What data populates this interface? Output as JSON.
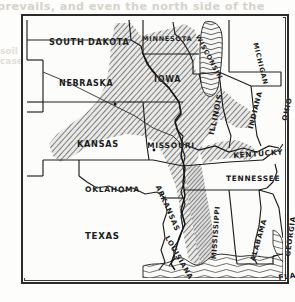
{
  "page": {
    "bleed_text_top": "prevails, and even the north side of the",
    "bleed_text_left": "soil in all cases",
    "background_color": "#fdfdfb",
    "ink_color": "#1b1b1b",
    "frame_color": "#2b2b2b",
    "shading_color": "#8a8a8a",
    "water_color": "#6f6f6f"
  },
  "map": {
    "title": "",
    "kind": "thematic-region-map",
    "legend_note": "",
    "region_fill_style": "diagonal-hatch",
    "labels": [
      {
        "name": "south-dakota",
        "text": "SOUTH DAKOTA",
        "x": 26,
        "y": 22,
        "rotate": 0,
        "size": 8.2
      },
      {
        "name": "minnesota",
        "text": "MINNESOTA",
        "x": 119,
        "y": 20,
        "rotate": 0,
        "size": 6.6
      },
      {
        "name": "wisconsin",
        "text": "WISCONSIN",
        "x": 177,
        "y": 18,
        "rotate": 62,
        "size": 6.6
      },
      {
        "name": "michigan",
        "text": "MICHIGAN",
        "x": 235,
        "y": 26,
        "rotate": 76,
        "size": 6.6
      },
      {
        "name": "nebraska",
        "text": "NEBRASKA",
        "x": 36,
        "y": 64,
        "rotate": 0,
        "size": 8.0
      },
      {
        "name": "iowa",
        "text": "IOWA",
        "x": 131,
        "y": 60,
        "rotate": 0,
        "size": 8.0
      },
      {
        "name": "illinois",
        "text": "ILLINOIS",
        "x": 185,
        "y": 118,
        "rotate": -78,
        "size": 7.6
      },
      {
        "name": "indiana",
        "text": "INDIANA",
        "x": 225,
        "y": 112,
        "rotate": -76,
        "size": 7.0
      },
      {
        "name": "ohio",
        "text": "OHIO",
        "x": 258,
        "y": 104,
        "rotate": -78,
        "size": 7.2
      },
      {
        "name": "kansas",
        "text": "KANSAS",
        "x": 54,
        "y": 124,
        "rotate": 0,
        "size": 8.2
      },
      {
        "name": "missouri",
        "text": "MISSOURI",
        "x": 124,
        "y": 126,
        "rotate": 0,
        "size": 7.6
      },
      {
        "name": "kentucky",
        "text": "KENTUCKY",
        "x": 210,
        "y": 136,
        "rotate": -4,
        "size": 7.4
      },
      {
        "name": "tennessee",
        "text": "TENNESSEE",
        "x": 203,
        "y": 159,
        "rotate": 0,
        "size": 7.4
      },
      {
        "name": "oklahoma",
        "text": "OKLAHOMA",
        "x": 62,
        "y": 170,
        "rotate": 0,
        "size": 7.6
      },
      {
        "name": "arkansas",
        "text": "ARKANSAS",
        "x": 138,
        "y": 168,
        "rotate": 66,
        "size": 7.2
      },
      {
        "name": "texas",
        "text": "TEXAS",
        "x": 62,
        "y": 216,
        "rotate": 0,
        "size": 8.6
      },
      {
        "name": "louisiana",
        "text": "LOUISIANA",
        "x": 146,
        "y": 219,
        "rotate": 60,
        "size": 7.0
      },
      {
        "name": "mississippi",
        "text": "MISSISSIPPI",
        "x": 188,
        "y": 243,
        "rotate": -86,
        "size": 6.8
      },
      {
        "name": "alabama",
        "text": "ALABAMA",
        "x": 227,
        "y": 244,
        "rotate": -74,
        "size": 7.0
      },
      {
        "name": "georgia",
        "text": "GEORGIA",
        "x": 262,
        "y": 240,
        "rotate": -82,
        "size": 7.0
      },
      {
        "name": "florida",
        "text": "FLA.",
        "x": 255,
        "y": 258,
        "rotate": -8,
        "size": 7.4
      }
    ],
    "water_bodies": [
      {
        "name": "lake-michigan",
        "label": ""
      },
      {
        "name": "gulf-of-mexico",
        "label": ""
      }
    ],
    "city_dots": [
      {
        "name": "city-dot-nebraska"
      },
      {
        "name": "city-dot-missouri"
      },
      {
        "name": "city-dot-southern-missouri"
      }
    ]
  }
}
